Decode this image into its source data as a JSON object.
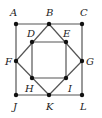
{
  "diagram": {
    "line_color": "#555555",
    "point_color": "#111111",
    "points": [
      {
        "id": "A",
        "label": "A",
        "x": 16,
        "y": 24,
        "lx": 10,
        "ly": 16
      },
      {
        "id": "B",
        "label": "B",
        "x": 49,
        "y": 24,
        "lx": 46,
        "ly": 16
      },
      {
        "id": "C",
        "label": "C",
        "x": 82,
        "y": 24,
        "lx": 80,
        "ly": 16
      },
      {
        "id": "D",
        "label": "D",
        "x": 32,
        "y": 42,
        "lx": 27,
        "ly": 37
      },
      {
        "id": "E",
        "label": "E",
        "x": 66,
        "y": 42,
        "lx": 63,
        "ly": 37
      },
      {
        "id": "F",
        "label": "F",
        "x": 16,
        "y": 61,
        "lx": 5,
        "ly": 65
      },
      {
        "id": "G",
        "label": "G",
        "x": 82,
        "y": 61,
        "lx": 86,
        "ly": 65
      },
      {
        "id": "H",
        "label": "H",
        "x": 32,
        "y": 78,
        "lx": 25,
        "ly": 92
      },
      {
        "id": "I",
        "label": "I",
        "x": 66,
        "y": 78,
        "lx": 68,
        "ly": 92
      },
      {
        "id": "J",
        "label": "J",
        "x": 16,
        "y": 95,
        "lx": 13,
        "ly": 110
      },
      {
        "id": "K",
        "label": "K",
        "x": 49,
        "y": 95,
        "lx": 46,
        "ly": 110
      },
      {
        "id": "L",
        "label": "L",
        "x": 82,
        "y": 95,
        "lx": 80,
        "ly": 110
      }
    ],
    "segments": [
      [
        "A",
        "C"
      ],
      [
        "C",
        "L"
      ],
      [
        "L",
        "J"
      ],
      [
        "J",
        "A"
      ],
      [
        "B",
        "G"
      ],
      [
        "G",
        "K"
      ],
      [
        "K",
        "F"
      ],
      [
        "F",
        "B"
      ],
      [
        "D",
        "E"
      ],
      [
        "E",
        "I"
      ],
      [
        "I",
        "H"
      ],
      [
        "H",
        "D"
      ]
    ]
  }
}
